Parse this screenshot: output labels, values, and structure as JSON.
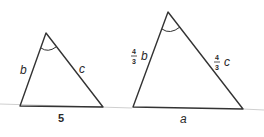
{
  "diagram": {
    "colors": {
      "line": "#333333",
      "faint_line": "#cfcfcf",
      "text": "#2a2a2a"
    },
    "triangle_small": {
      "apex": [
        46,
        33
      ],
      "bottom_left": [
        20,
        106
      ],
      "bottom_right": [
        103,
        107
      ],
      "labels": {
        "left_side": "b",
        "right_side": "c",
        "base": "5"
      },
      "angle_marker": "apex-arc"
    },
    "triangle_large": {
      "apex": [
        168,
        12
      ],
      "bottom_left": [
        133,
        107
      ],
      "bottom_right": [
        243,
        109
      ],
      "labels": {
        "left_side_coef_num": "4",
        "left_side_coef_den": "3",
        "left_side_var": "b",
        "right_side_coef_num": "4",
        "right_side_coef_den": "3",
        "right_side_var": "c",
        "base": "a"
      },
      "angle_marker": "apex-arc"
    }
  }
}
